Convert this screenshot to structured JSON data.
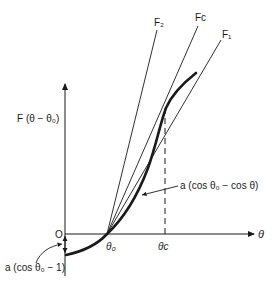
{
  "figure": {
    "y_axis_label": "F (θ − θ₀)",
    "x_axis_label": "θ",
    "origin_label": "O",
    "theta0_label": "θ₀",
    "thetac_label": "θc",
    "lines": [
      {
        "name": "F₂"
      },
      {
        "name": "Fc"
      },
      {
        "name": "F₁"
      }
    ],
    "annotations": {
      "curve": "a (cos θ₀ − cos θ)",
      "offset": "a (cos θ₀ − 1)"
    },
    "colors": {
      "ink": "#1a1a1a",
      "background": "#ffffff"
    }
  }
}
